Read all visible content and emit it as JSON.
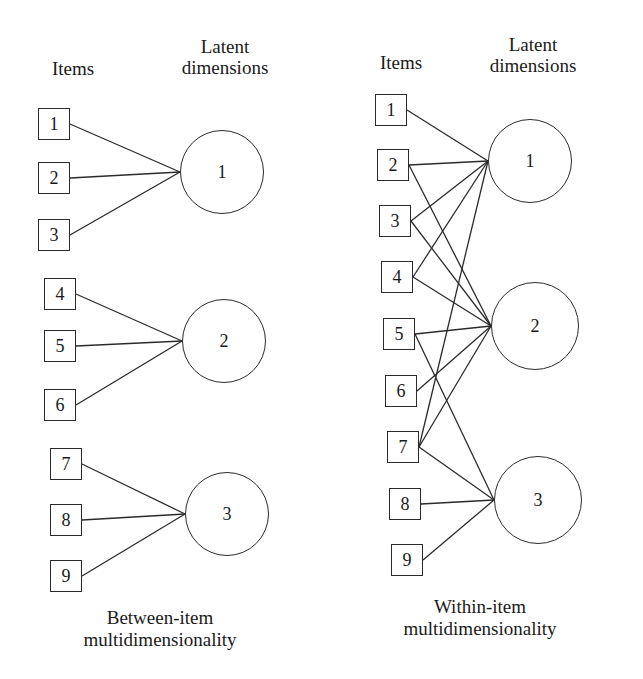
{
  "figure": {
    "type": "diagram",
    "background_color": "#ffffff",
    "line_color": "#2b2b2b",
    "text_color": "#1a1a1a"
  },
  "panels": [
    {
      "id": "between-item",
      "headers": {
        "items": "Items",
        "dimensions": "Latent\ndimensions"
      },
      "caption": "Between-item\nmultidimensionality",
      "items": [
        {
          "label": "1",
          "x": 38,
          "y": 108
        },
        {
          "label": "2",
          "x": 38,
          "y": 162
        },
        {
          "label": "3",
          "x": 38,
          "y": 219
        },
        {
          "label": "4",
          "x": 44,
          "y": 278
        },
        {
          "label": "5",
          "x": 44,
          "y": 330
        },
        {
          "label": "6",
          "x": 44,
          "y": 389
        },
        {
          "label": "7",
          "x": 50,
          "y": 448
        },
        {
          "label": "8",
          "x": 50,
          "y": 504
        },
        {
          "label": "9",
          "x": 50,
          "y": 560
        }
      ],
      "dimensions": [
        {
          "label": "1",
          "cx": 222,
          "cy": 172,
          "r": 42
        },
        {
          "cx": 224,
          "cy": 341,
          "r": 42,
          "label": "2"
        },
        {
          "label": "3",
          "cx": 227,
          "cy": 514,
          "r": 42
        }
      ],
      "edges": [
        {
          "from": 0,
          "to": 0
        },
        {
          "from": 1,
          "to": 0
        },
        {
          "from": 2,
          "to": 0
        },
        {
          "from": 3,
          "to": 1
        },
        {
          "from": 4,
          "to": 1
        },
        {
          "from": 5,
          "to": 1
        },
        {
          "from": 6,
          "to": 2
        },
        {
          "from": 7,
          "to": 2
        },
        {
          "from": 8,
          "to": 2
        }
      ]
    },
    {
      "id": "within-item",
      "headers": {
        "items": "Items",
        "dimensions": "Latent\ndimensions"
      },
      "caption": "Within-item\nmultidimensionality",
      "items": [
        {
          "label": "1",
          "x": 45,
          "y": 94
        },
        {
          "label": "2",
          "x": 47,
          "y": 149
        },
        {
          "label": "3",
          "x": 49,
          "y": 205
        },
        {
          "label": "4",
          "x": 51,
          "y": 261
        },
        {
          "label": "5",
          "x": 53,
          "y": 318
        },
        {
          "label": "6",
          "x": 55,
          "y": 375
        },
        {
          "label": "7",
          "x": 57,
          "y": 431
        },
        {
          "label": "8",
          "x": 59,
          "y": 488
        },
        {
          "label": "9",
          "x": 61,
          "y": 544
        }
      ],
      "dimensions": [
        {
          "label": "1",
          "cx": 200,
          "cy": 161,
          "r": 42
        },
        {
          "label": "2",
          "cx": 205,
          "cy": 326,
          "r": 44
        },
        {
          "label": "3",
          "cx": 208,
          "cy": 500,
          "r": 44
        }
      ],
      "edges": [
        {
          "from": 0,
          "to": 0
        },
        {
          "from": 1,
          "to": 0
        },
        {
          "from": 2,
          "to": 0
        },
        {
          "from": 3,
          "to": 0
        },
        {
          "from": 6,
          "to": 0
        },
        {
          "from": 1,
          "to": 1
        },
        {
          "from": 2,
          "to": 1
        },
        {
          "from": 3,
          "to": 1
        },
        {
          "from": 4,
          "to": 1
        },
        {
          "from": 5,
          "to": 1
        },
        {
          "from": 6,
          "to": 1
        },
        {
          "from": 4,
          "to": 2
        },
        {
          "from": 6,
          "to": 2
        },
        {
          "from": 7,
          "to": 2
        },
        {
          "from": 8,
          "to": 2
        }
      ]
    }
  ],
  "layout": {
    "panel_left_header_items_x": 28,
    "panel_left_header_items_y": 58,
    "panel_left_header_dims_x": 150,
    "panel_left_header_dims_y": 36,
    "panel_left_caption_x": 10,
    "panel_left_caption_y": 607,
    "panel_right_header_items_x": 26,
    "panel_right_header_items_y": 52,
    "panel_right_header_dims_x": 128,
    "panel_right_header_dims_y": 34,
    "panel_right_caption_x": 0,
    "panel_right_caption_y": 596
  }
}
